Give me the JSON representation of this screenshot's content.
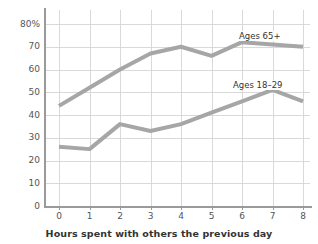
{
  "chart_data": {
    "type": "line",
    "title": "",
    "subtitle": "",
    "xlabel": "Hours spent with others the previous day",
    "ylabel": "",
    "x": [
      0,
      1,
      2,
      3,
      4,
      5,
      6,
      7,
      8
    ],
    "xtick_labels": [
      "0",
      "1",
      "2",
      "3",
      "4",
      "5",
      "6",
      "7",
      "8"
    ],
    "ytick_labels": [
      "0",
      "10",
      "20",
      "30",
      "40",
      "50",
      "60",
      "70",
      "80%"
    ],
    "ytick_values": [
      0,
      10,
      20,
      30,
      40,
      50,
      60,
      70,
      80
    ],
    "xlim": [
      0,
      8
    ],
    "ylim": [
      0,
      80
    ],
    "grid": true,
    "legend_position": "inline-annotation",
    "series": [
      {
        "name": "Ages 65+",
        "label": "Ages 65+",
        "color": "#a6a6a6",
        "values": [
          44,
          52,
          60,
          67,
          70,
          66,
          72,
          71,
          70
        ]
      },
      {
        "name": "Ages 18–29",
        "label": "Ages 18–29",
        "color": "#a6a6a6",
        "values": [
          26,
          25,
          36,
          33,
          36,
          41,
          46,
          51,
          46
        ]
      }
    ],
    "annotations": [
      {
        "text": "Ages 65+",
        "x": 6.3,
        "y": 77
      },
      {
        "text": "Ages 18–29",
        "x": 6.1,
        "y": 56
      }
    ],
    "colors": {
      "series_line": "#a6a6a6",
      "gridline": "#d9d9d9",
      "axis": "#9a9a9a",
      "tick_text": "#555555",
      "title_text": "#333333",
      "background": "#ffffff"
    }
  }
}
